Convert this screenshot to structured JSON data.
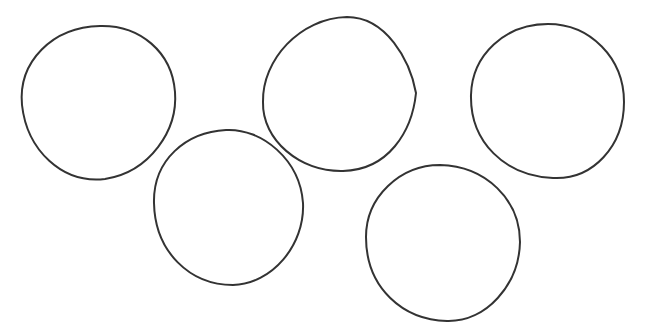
{
  "drawing": {
    "subject": "five hand-drawn circles",
    "arrangement": "two rows: three circles on top, two below (Olympic-rings style)",
    "stroke_color": "#333333",
    "background_color": "#ffffff",
    "circles": [
      {
        "id": "circle-1",
        "row": "top",
        "position": "left"
      },
      {
        "id": "circle-2",
        "row": "bottom",
        "position": "left"
      },
      {
        "id": "circle-3",
        "row": "top",
        "position": "center"
      },
      {
        "id": "circle-4",
        "row": "top",
        "position": "right"
      },
      {
        "id": "circle-5",
        "row": "bottom",
        "position": "right"
      }
    ]
  }
}
